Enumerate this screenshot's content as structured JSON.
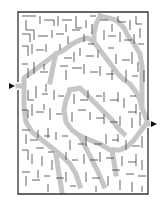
{
  "puzzle": {
    "type": "maze",
    "background": "#ffffff",
    "wall_color": "#333333",
    "path_color": "#c8c8c8",
    "border": {
      "x": 18,
      "y": 12,
      "width": 130,
      "height": 182
    },
    "entrance": {
      "side": "left",
      "y": 86
    },
    "exit": {
      "side": "right",
      "y": 124
    }
  }
}
